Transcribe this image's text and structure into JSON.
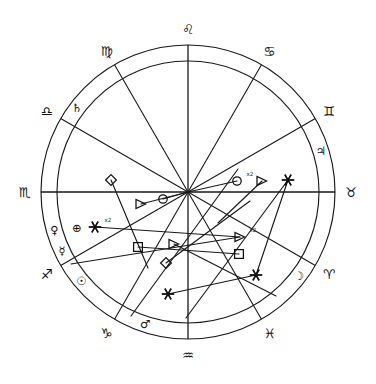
{
  "chart": {
    "kind": "astrology-wheel",
    "center": {
      "x": 188,
      "y": 192
    },
    "radii": {
      "outer_circle": 147,
      "sign_ring_inner": 131,
      "house_ring": 131
    },
    "stroke_color": "#1a1a1a",
    "background_color": "#ffffff"
  },
  "chart_data": {
    "type": "scatter",
    "xlabel": "",
    "ylabel": "",
    "zodiac_signs": [
      {
        "name": "Leo",
        "glyph": "♌",
        "angle_deg": 90,
        "label_radius": 163,
        "rotate": 0
      },
      {
        "name": "Cancer",
        "glyph": "♋",
        "angle_deg": 60,
        "label_radius": 163,
        "rotate": 0
      },
      {
        "name": "Gemini",
        "glyph": "♊",
        "angle_deg": 30,
        "label_radius": 163,
        "rotate": 0
      },
      {
        "name": "Taurus",
        "glyph": "♉",
        "angle_deg": 0,
        "label_radius": 163,
        "rotate": 0
      },
      {
        "name": "Aries",
        "glyph": "♈",
        "angle_deg": -30,
        "label_radius": 163,
        "rotate": 0
      },
      {
        "name": "Pisces",
        "glyph": "♓",
        "angle_deg": -60,
        "label_radius": 163,
        "rotate": 0
      },
      {
        "name": "Aquarius",
        "glyph": "♒",
        "angle_deg": -90,
        "label_radius": 163,
        "rotate": 0
      },
      {
        "name": "Capricorn",
        "glyph": "♑",
        "angle_deg": -120,
        "label_radius": 163,
        "rotate": 0
      },
      {
        "name": "Sagittarius",
        "glyph": "♐",
        "angle_deg": -150,
        "label_radius": 163,
        "rotate": 0
      },
      {
        "name": "Scorpio",
        "glyph": "♏",
        "angle_deg": 180,
        "label_radius": 163,
        "rotate": 0
      },
      {
        "name": "Libra",
        "glyph": "♎",
        "angle_deg": 150,
        "label_radius": 163,
        "rotate": 0
      },
      {
        "name": "Virgo",
        "glyph": "♍",
        "angle_deg": 120,
        "label_radius": 163,
        "rotate": 0
      }
    ],
    "planets": [
      {
        "name": "Saturn",
        "glyph": "♄",
        "angle_deg": 143,
        "radius": 139
      },
      {
        "name": "Venus",
        "glyph": "♀",
        "angle_deg": 196,
        "radius": 139
      },
      {
        "name": "Earth",
        "glyph": "⊕",
        "angle_deg": 198,
        "radius": 117
      },
      {
        "name": "Mercury",
        "glyph": "☿",
        "angle_deg": 205,
        "radius": 139
      },
      {
        "name": "Sun",
        "glyph": "☉",
        "angle_deg": 220,
        "radius": 139
      },
      {
        "name": "Mars",
        "glyph": "♂",
        "angle_deg": 252,
        "radius": 139
      },
      {
        "name": "Moon",
        "glyph": "☽",
        "angle_deg": -37,
        "radius": 139
      },
      {
        "name": "Jupiter",
        "glyph": "♃",
        "angle_deg": 17,
        "radius": 139
      }
    ],
    "house_cusp_angles_deg": [
      90,
      60,
      30,
      0,
      -30,
      -60,
      -90,
      -120,
      -150,
      180,
      150,
      120
    ],
    "aspect_markers": [
      {
        "aspect": "opposition",
        "glyph": "circle",
        "x": 237,
        "y": 181,
        "multiplier": "x2"
      },
      {
        "aspect": "trine",
        "glyph": "triangle",
        "x": 262,
        "y": 181,
        "multiplier": ""
      },
      {
        "aspect": "sextile",
        "glyph": "star",
        "x": 288,
        "y": 180,
        "multiplier": ""
      },
      {
        "aspect": "opposition",
        "glyph": "circle",
        "x": 163,
        "y": 199,
        "multiplier": ""
      },
      {
        "aspect": "trine",
        "glyph": "triangle",
        "x": 141,
        "y": 204,
        "multiplier": ""
      },
      {
        "aspect": "semisquare",
        "glyph": "diamond",
        "x": 111,
        "y": 180,
        "multiplier": ""
      },
      {
        "aspect": "sextile",
        "glyph": "star",
        "x": 95,
        "y": 227,
        "multiplier": "x2"
      },
      {
        "aspect": "trine",
        "glyph": "triangle",
        "x": 240,
        "y": 237,
        "multiplier": "x2"
      },
      {
        "aspect": "trine",
        "glyph": "triangle",
        "x": 174,
        "y": 244,
        "multiplier": ""
      },
      {
        "aspect": "square",
        "glyph": "square",
        "x": 138,
        "y": 247,
        "multiplier": ""
      },
      {
        "aspect": "square",
        "glyph": "square",
        "x": 239,
        "y": 254,
        "multiplier": ""
      },
      {
        "aspect": "semisquare",
        "glyph": "diamond",
        "x": 166,
        "y": 263,
        "multiplier": ""
      },
      {
        "aspect": "sextile",
        "glyph": "star",
        "x": 256,
        "y": 275,
        "multiplier": ""
      },
      {
        "aspect": "sextile",
        "glyph": "star",
        "x": 168,
        "y": 294,
        "multiplier": ""
      }
    ],
    "aspect_lines": [
      {
        "from": [
          188,
          192
        ],
        "to": [
          237,
          181
        ]
      },
      {
        "from": [
          188,
          192
        ],
        "to": [
          163,
          199
        ]
      },
      {
        "from": [
          188,
          192
        ],
        "to": [
          141,
          204
        ]
      },
      {
        "from": [
          111,
          180
        ],
        "to": [
          148,
          268
        ]
      },
      {
        "from": [
          262,
          181
        ],
        "to": [
          218,
          223
        ]
      },
      {
        "from": [
          288,
          180
        ],
        "to": [
          256,
          275
        ]
      },
      {
        "from": [
          95,
          227
        ],
        "to": [
          240,
          237
        ]
      },
      {
        "from": [
          138,
          247
        ],
        "to": [
          239,
          254
        ]
      },
      {
        "from": [
          166,
          263
        ],
        "to": [
          250,
          201
        ]
      },
      {
        "from": [
          168,
          294
        ],
        "to": [
          256,
          275
        ]
      },
      {
        "from": [
          174,
          244
        ],
        "to": [
          276,
          296
        ]
      },
      {
        "from": [
          131,
          316
        ],
        "to": [
          238,
          169
        ]
      },
      {
        "from": [
          71,
          264
        ],
        "to": [
          240,
          237
        ]
      },
      {
        "from": [
          186,
          318
        ],
        "to": [
          288,
          180
        ]
      }
    ],
    "aspect_legend": [
      {
        "aspect": "conjunction",
        "symbol": "☌"
      },
      {
        "aspect": "opposition",
        "symbol": "☍"
      },
      {
        "aspect": "trine",
        "symbol": "△"
      },
      {
        "aspect": "square",
        "symbol": "□"
      },
      {
        "aspect": "sextile",
        "symbol": "✶"
      },
      {
        "aspect": "semisquare",
        "symbol": "◇"
      }
    ],
    "multiplier_labels": [
      "x2",
      "x2",
      "x2"
    ],
    "grid": false,
    "legend_position": "none"
  }
}
